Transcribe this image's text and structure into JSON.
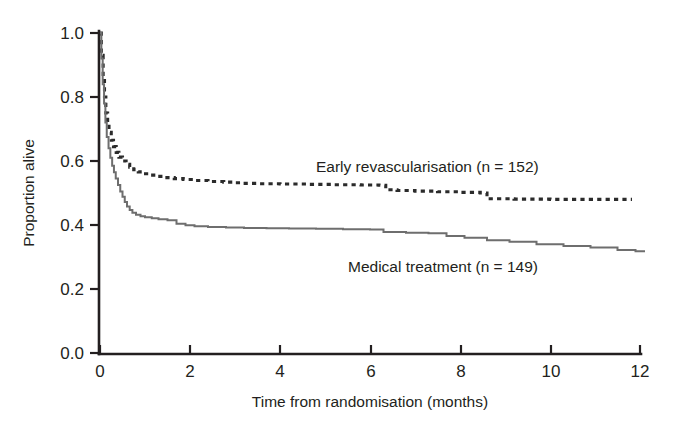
{
  "chart_data": {
    "type": "line",
    "title": "",
    "xlabel": "Time from randomisation (months)",
    "ylabel": "Proportion alive",
    "xlim": [
      0,
      12
    ],
    "ylim": [
      0.0,
      1.0
    ],
    "xticks": [
      "0",
      "2",
      "4",
      "6",
      "8",
      "10",
      "12"
    ],
    "xtick_values": [
      0,
      2,
      4,
      6,
      8,
      10,
      12
    ],
    "yticks": [
      "0.0",
      "0.2",
      "0.4",
      "0.6",
      "0.8",
      "1.0"
    ],
    "ytick_values": [
      0.0,
      0.2,
      0.4,
      0.6,
      0.8,
      1.0
    ],
    "grid": false,
    "legend_position": "inline-annotation",
    "series": [
      {
        "name": "Early revascularisation (n = 152)",
        "label": "Early revascularisation (n = 152)",
        "n": 152,
        "style": "dashed",
        "color": "#2b2b2b",
        "step": "post",
        "x": [
          0,
          0.03,
          0.07,
          0.1,
          0.13,
          0.17,
          0.2,
          0.25,
          0.3,
          0.36,
          0.42,
          0.5,
          0.58,
          0.66,
          0.75,
          0.85,
          0.95,
          1.1,
          1.25,
          1.45,
          1.65,
          1.85,
          2.1,
          2.4,
          2.75,
          2.95,
          3.15,
          3.5,
          4.0,
          4.6,
          5.2,
          5.8,
          6.2,
          6.35,
          6.6,
          7.0,
          7.5,
          8.0,
          8.45,
          8.6,
          9.2,
          10.0,
          10.8,
          11.7
        ],
        "y": [
          1.0,
          0.93,
          0.86,
          0.8,
          0.75,
          0.715,
          0.69,
          0.665,
          0.645,
          0.627,
          0.612,
          0.6,
          0.59,
          0.581,
          0.573,
          0.566,
          0.56,
          0.556,
          0.552,
          0.548,
          0.545,
          0.542,
          0.539,
          0.536,
          0.534,
          0.532,
          0.53,
          0.529,
          0.528,
          0.527,
          0.526,
          0.525,
          0.524,
          0.51,
          0.508,
          0.506,
          0.504,
          0.502,
          0.5,
          0.482,
          0.481,
          0.48,
          0.48,
          0.48
        ],
        "final_value": 0.48
      },
      {
        "name": "Medical treatment (n = 149)",
        "label": "Medical treatment (n = 149)",
        "n": 149,
        "style": "solid",
        "color": "#6e6e6e",
        "step": "post",
        "x": [
          0,
          0.03,
          0.06,
          0.09,
          0.12,
          0.15,
          0.19,
          0.23,
          0.27,
          0.31,
          0.35,
          0.4,
          0.45,
          0.5,
          0.55,
          0.6,
          0.66,
          0.72,
          0.8,
          0.9,
          1.0,
          1.15,
          1.3,
          1.5,
          1.7,
          1.9,
          2.1,
          2.4,
          2.8,
          3.2,
          3.7,
          4.2,
          4.8,
          5.4,
          6.0,
          6.3,
          6.8,
          7.3,
          7.7,
          8.1,
          8.6,
          9.1,
          9.7,
          10.3,
          10.9,
          11.5,
          11.9
        ],
        "y": [
          1.0,
          0.92,
          0.84,
          0.78,
          0.72,
          0.675,
          0.64,
          0.61,
          0.585,
          0.565,
          0.545,
          0.525,
          0.505,
          0.488,
          0.472,
          0.458,
          0.447,
          0.438,
          0.432,
          0.427,
          0.424,
          0.421,
          0.418,
          0.415,
          0.404,
          0.399,
          0.396,
          0.394,
          0.392,
          0.391,
          0.39,
          0.389,
          0.388,
          0.387,
          0.386,
          0.378,
          0.376,
          0.374,
          0.366,
          0.36,
          0.352,
          0.348,
          0.34,
          0.334,
          0.33,
          0.322,
          0.318
        ],
        "final_value": 0.318
      }
    ]
  },
  "annotations": {
    "early_revascularisation": "Early revascularisation (n = 152)",
    "medical_treatment": "Medical treatment (n = 149)"
  },
  "axes": {
    "x_title": "Time from randomisation (months)",
    "y_title": "Proportion alive"
  }
}
